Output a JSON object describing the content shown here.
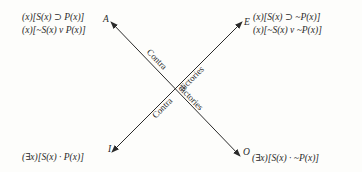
{
  "diagram": {
    "title": "",
    "corners": {
      "A": {
        "letter": "A",
        "formulas": [
          "(x)[S(x) ⊃ P(x)]",
          "(x)[~S(x) v P(x)]"
        ]
      },
      "E": {
        "letter": "E",
        "formulas": [
          "(x)[S(x) ⊃ ~P(x)]",
          "(x)[~S(x) v ~P(x)]"
        ]
      },
      "I": {
        "letter": "I",
        "formulas": [
          "(∃x)[S(x) · P(x)]"
        ]
      },
      "O": {
        "letter": "O",
        "formulas": [
          "(∃x)[S(x) · ~P(x)]"
        ]
      }
    },
    "edges": [
      {
        "from": "I",
        "to": "E",
        "label_parts": [
          "Contra",
          "dictories"
        ],
        "arrows": "both"
      },
      {
        "from": "A",
        "to": "O",
        "label_parts": [
          "Contra",
          "dictories"
        ],
        "arrows": "both"
      }
    ],
    "colors": {
      "line": "#2a2a2a",
      "text": "#2a2a2a",
      "background": "#fdfdfb"
    }
  }
}
